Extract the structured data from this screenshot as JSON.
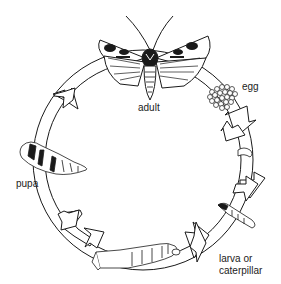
{
  "diagram": {
    "stages": [
      {
        "id": "adult",
        "label": "adult"
      },
      {
        "id": "egg",
        "label": "egg"
      },
      {
        "id": "larva",
        "label_line1": "larva or",
        "label_line2": "caterpillar"
      },
      {
        "id": "pupa",
        "label": "pupa"
      }
    ],
    "colors": {
      "stroke": "#1a1a1a",
      "fill": "#ffffff"
    }
  }
}
